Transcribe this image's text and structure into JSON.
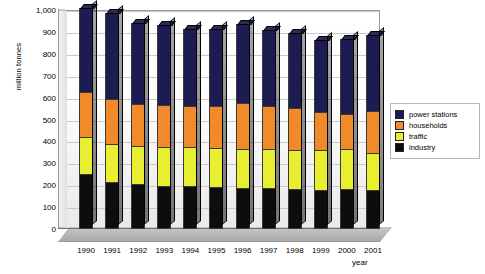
{
  "chart_data": {
    "type": "bar",
    "stacked": true,
    "title": "",
    "xlabel": "year",
    "ylabel": "million tonnes",
    "ylim": [
      0,
      1000
    ],
    "yticks": [
      "0",
      "100",
      "200",
      "300",
      "400",
      "500",
      "600",
      "700",
      "800",
      "900",
      "1,000"
    ],
    "grid": true,
    "legend_position": "right",
    "categories": [
      "1990",
      "1991",
      "1992",
      "1993",
      "1994",
      "1995",
      "1996",
      "1997",
      "1998",
      "1999",
      "2000",
      "2001"
    ],
    "series": [
      {
        "name": "industry",
        "color": "#0d0d0d",
        "values": [
          245,
          212,
          200,
          190,
          192,
          186,
          183,
          181,
          178,
          174,
          176,
          172
        ]
      },
      {
        "name": "traffic",
        "color": "#e8ee30",
        "values": [
          170,
          173,
          175,
          178,
          178,
          178,
          178,
          178,
          178,
          184,
          183,
          171
        ]
      },
      {
        "name": "households",
        "color": "#f08a2a",
        "values": [
          205,
          205,
          190,
          195,
          186,
          192,
          209,
          200,
          193,
          174,
          163,
          192
        ]
      },
      {
        "name": "power stations",
        "color": "#1c1c52",
        "values": [
          390,
          395,
          375,
          367,
          356,
          358,
          365,
          349,
          348,
          332,
          345,
          353
        ]
      }
    ],
    "totals": [
      1010,
      985,
      940,
      930,
      912,
      914,
      935,
      908,
      897,
      864,
      867,
      888
    ]
  },
  "legend": {
    "items": [
      {
        "label": "power stations",
        "color": "#1c1c52"
      },
      {
        "label": "households",
        "color": "#f08a2a"
      },
      {
        "label": "traffic",
        "color": "#e8ee30"
      },
      {
        "label": "industry",
        "color": "#0d0d0d"
      }
    ]
  }
}
